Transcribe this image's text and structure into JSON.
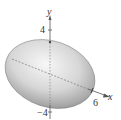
{
  "diagram": {
    "type": "ellipsoid-3d-plot",
    "axes": {
      "y_label": "y",
      "x_label": "x",
      "y_tick_top": "4",
      "y_tick_bottom": "−4",
      "x_tick": "6"
    },
    "colors": {
      "surface_light": "#f4f4f4",
      "surface_dark": "#8a8a8a",
      "axis": "#555555"
    }
  }
}
